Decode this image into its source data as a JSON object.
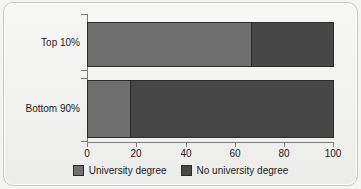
{
  "chart_data": {
    "type": "bar",
    "orientation": "horizontal",
    "stacked": true,
    "stack_mode": "percent",
    "title": "",
    "subtitle": "",
    "xlabel": "",
    "ylabel": "",
    "xlim": [
      0,
      100
    ],
    "xticks": [
      0,
      20,
      40,
      60,
      80,
      100
    ],
    "xtick_labels": [
      "0",
      "20",
      "40",
      "60",
      "80",
      "100"
    ],
    "grid": false,
    "legend_position": "bottom",
    "categories": [
      "Top 10%",
      "Bottom 90%"
    ],
    "series": [
      {
        "name": "University degree",
        "color": "#6e6e6e",
        "values": [
          67,
          17.5
        ]
      },
      {
        "name": "No university degree",
        "color": "#474747",
        "values": [
          33,
          82.5
        ]
      }
    ]
  },
  "axis": {
    "x": {
      "ticks": [
        {
          "value": 0,
          "label": "0"
        },
        {
          "value": 20,
          "label": "20"
        },
        {
          "value": 40,
          "label": "40"
        },
        {
          "value": 60,
          "label": "60"
        },
        {
          "value": 80,
          "label": "80"
        },
        {
          "value": 100,
          "label": "100"
        }
      ]
    },
    "y": {
      "categories": [
        {
          "label": "Top 10%"
        },
        {
          "label": "Bottom 90%"
        }
      ]
    }
  },
  "legend": {
    "items": [
      {
        "label": "University degree",
        "color": "#6e6e6e"
      },
      {
        "label": "No university degree",
        "color": "#474747"
      }
    ]
  },
  "colors": {
    "university_degree": "#6e6e6e",
    "no_university_degree": "#474747",
    "axis": "#7a7a78",
    "bar_outline": "#2b2b2b",
    "background": "#f2f2f0"
  }
}
